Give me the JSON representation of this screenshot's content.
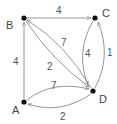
{
  "nodes": [
    {
      "id": "A",
      "label": "A",
      "x": 24,
      "y": 102,
      "lx": 12,
      "ly": 114
    },
    {
      "id": "B",
      "label": "B",
      "x": 24,
      "y": 18,
      "lx": 6,
      "ly": 29
    },
    {
      "id": "C",
      "label": "C",
      "x": 95,
      "y": 18,
      "lx": 103,
      "ly": 16
    },
    {
      "id": "D",
      "label": "D",
      "x": 93,
      "y": 91,
      "lx": 100,
      "ly": 103
    }
  ],
  "edges": [
    {
      "from": "A",
      "to": "B",
      "weight": "4",
      "lx": 14,
      "ly": 64
    },
    {
      "from": "B",
      "to": "C",
      "weight": "4",
      "lx": 57,
      "ly": 13
    },
    {
      "from": "D",
      "to": "B",
      "weight": "7",
      "lx": 61,
      "ly": 46
    },
    {
      "from": "B",
      "to": "D",
      "weight": "2",
      "lx": 48,
      "ly": 70
    },
    {
      "from": "A",
      "to": "D",
      "weight": "7",
      "lx": 52,
      "ly": 89
    },
    {
      "from": "D",
      "to": "A",
      "weight": "2",
      "lx": 61,
      "ly": 120
    },
    {
      "from": "C",
      "to": "D",
      "weight": "4",
      "lx": 85,
      "ly": 57
    },
    {
      "from": "D",
      "to": "C",
      "weight": "1",
      "lx": 108,
      "ly": 55
    }
  ],
  "colors": {
    "edge": "#8a8a8a",
    "node": "#111111",
    "text": "#444444"
  }
}
